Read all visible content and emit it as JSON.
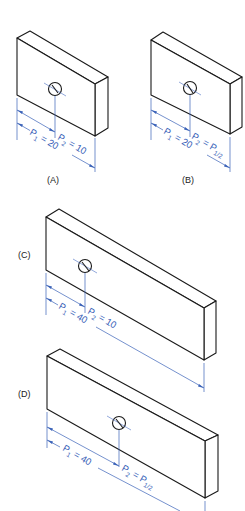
{
  "figure": {
    "panels": [
      {
        "id": "A",
        "label": "(A)",
        "p1": {
          "symbol": "P",
          "sub": "1",
          "eq": " = 20"
        },
        "p2": {
          "symbol": "P",
          "sub": "2",
          "eq": " = 10"
        }
      },
      {
        "id": "B",
        "label": "(B)",
        "p1": {
          "symbol": "P",
          "sub": "1",
          "eq": " = 20"
        },
        "p2": {
          "symbol": "P",
          "sub": "2",
          "eq": " = P",
          "eq_sub": "1/2"
        }
      },
      {
        "id": "C",
        "label": "(C)",
        "p1": {
          "symbol": "P",
          "sub": "1",
          "eq": " = 40"
        },
        "p2": {
          "symbol": "P",
          "sub": "2",
          "eq": " = 10"
        }
      },
      {
        "id": "D",
        "label": "(D)",
        "p1": {
          "symbol": "P",
          "sub": "1",
          "eq": " = 40"
        },
        "p2": {
          "symbol": "P",
          "sub": "2",
          "eq": " = P",
          "eq_sub": "1/2"
        }
      }
    ],
    "colors": {
      "outline": "#1a1a1a",
      "dimension": "#3a62b8"
    }
  }
}
